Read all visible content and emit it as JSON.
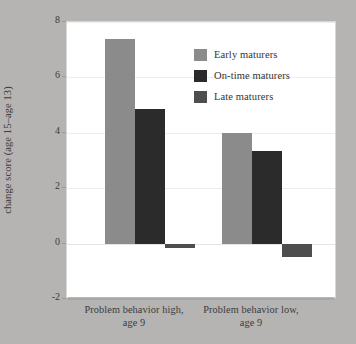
{
  "chart_data": {
    "type": "bar",
    "title": "",
    "xlabel": "",
    "ylabel": "Problem behavior change score (age 15–age 13)",
    "ylabel_lines": [
      "Problem behavior",
      "change score (age 15–age 13)"
    ],
    "categories": [
      "Problem behavior high, age 9",
      "Problem behavior low, age 9"
    ],
    "category_lines": [
      [
        "Problem behavior high,",
        "age 9"
      ],
      [
        "Problem behavior low,",
        "age 9"
      ]
    ],
    "series": [
      {
        "name": "Early maturers",
        "values": [
          7.4,
          4.0
        ],
        "color": "#8b8b8b"
      },
      {
        "name": "On-time maturers",
        "values": [
          4.85,
          3.35
        ],
        "color": "#2b2b2b"
      },
      {
        "name": "Late maturers",
        "values": [
          -0.15,
          -0.5
        ],
        "color": "#4e4e4e"
      }
    ],
    "ylim": [
      -2,
      8
    ],
    "yticks": [
      8,
      6,
      4,
      2,
      0,
      -2
    ],
    "ytick_labels": [
      "8",
      "6",
      "4",
      "2",
      "0",
      "-2"
    ],
    "grid": true,
    "legend_position": "upper center"
  },
  "legend": {
    "items": [
      {
        "label": "Early maturers",
        "color": "#8b8b8b"
      },
      {
        "label": "On-time maturers",
        "color": "#2b2b2b"
      },
      {
        "label": "Late maturers",
        "color": "#4e4e4e"
      }
    ]
  },
  "colors": {
    "background": "#b5b4b2",
    "plot_background": "#ffffff",
    "text": "#3b3b3b",
    "gridline": "#ededed"
  }
}
